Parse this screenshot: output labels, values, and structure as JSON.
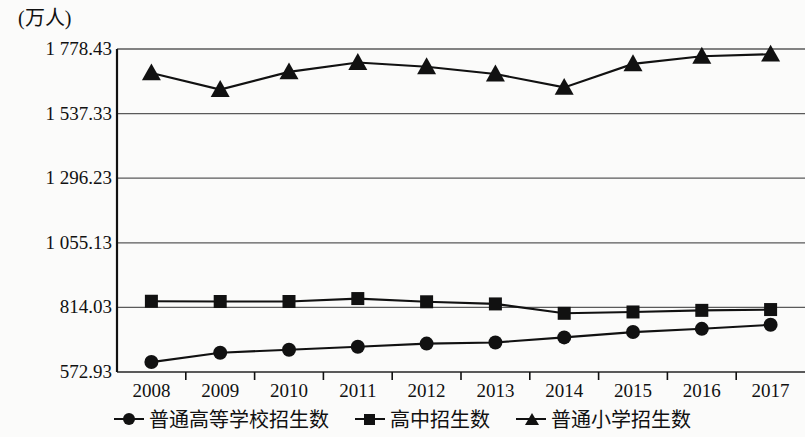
{
  "chart_data": {
    "type": "line",
    "title": "",
    "ylabel": "(万人)",
    "xlabel": "",
    "x": [
      "2008",
      "2009",
      "2010",
      "2011",
      "2012",
      "2013",
      "2014",
      "2015",
      "2016",
      "2017"
    ],
    "categories": [
      "2008",
      "2009",
      "2010",
      "2011",
      "2012",
      "2013",
      "2014",
      "2015",
      "2016",
      "2017"
    ],
    "ylim": [
      572.93,
      1778.43
    ],
    "yticks": [
      "1 778.43",
      "1 537.33",
      "1 296.23",
      "1 055.13",
      "814.03",
      "572.93"
    ],
    "ytick_values": [
      1778.43,
      1537.33,
      1296.23,
      1055.13,
      814.03,
      572.93
    ],
    "grid": true,
    "legend_position": "bottom",
    "series": [
      {
        "name": "普通高等学校招生数",
        "marker": "circle",
        "values": [
          610,
          645,
          656,
          667,
          679,
          683,
          702,
          722,
          734,
          749
        ]
      },
      {
        "name": "高中招生数",
        "marker": "square",
        "values": [
          837,
          836,
          836,
          847,
          835,
          827,
          792,
          797,
          803,
          806
        ]
      },
      {
        "name": "普通小学招生数",
        "marker": "triangle",
        "values": [
          1689,
          1627,
          1693,
          1728,
          1712,
          1685,
          1635,
          1723,
          1751,
          1759
        ]
      }
    ]
  },
  "legend": {
    "items": [
      {
        "label": "普通高等学校招生数",
        "marker": "circle-marker-icon"
      },
      {
        "label": "高中招生数",
        "marker": "square-marker-icon"
      },
      {
        "label": "普通小学招生数",
        "marker": "triangle-marker-icon"
      }
    ]
  },
  "colors": {
    "series": "#111111",
    "grid": "#5a5a5a",
    "axis": "#111111",
    "background": "#fbfbfa"
  }
}
